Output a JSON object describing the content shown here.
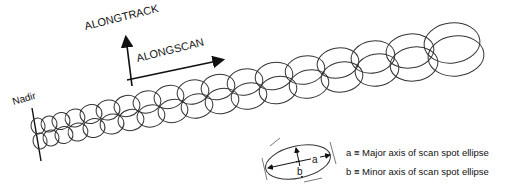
{
  "labels": {
    "alongtrack": "ALONGTRACK",
    "alongscan": "ALONGSCAN",
    "nadir": "Nadir",
    "ellipse_a": "a",
    "ellipse_b": "b"
  },
  "legend": {
    "a": "a ≡ Major axis of scan spot ellipse",
    "b": "b ≡ Minor axis of scan spot ellipse"
  },
  "colors": {
    "stroke": "#333333",
    "text": "#111111",
    "background": "#ffffff"
  }
}
